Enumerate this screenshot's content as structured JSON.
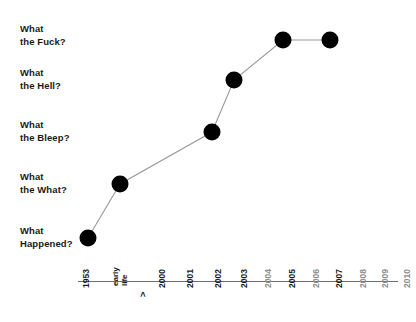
{
  "chart_data": {
    "type": "line",
    "title": "",
    "xlabel": "",
    "ylabel": "",
    "grid": false,
    "legend": "none",
    "x_tick_labels": [
      {
        "label": "1953",
        "emphasis": "bold",
        "stacked": false
      },
      {
        "label": "early life",
        "lines": [
          "early",
          "life"
        ],
        "emphasis": "bold",
        "stacked": true,
        "suffix": ">"
      },
      {
        "label": "2000",
        "emphasis": "bold",
        "stacked": false
      },
      {
        "label": "2001",
        "emphasis": "bold",
        "stacked": false
      },
      {
        "label": "2002",
        "emphasis": "bold",
        "stacked": false
      },
      {
        "label": "2003",
        "emphasis": "bold",
        "stacked": false
      },
      {
        "label": "2004",
        "emphasis": "dim",
        "stacked": false
      },
      {
        "label": "2005",
        "emphasis": "bold",
        "stacked": false
      },
      {
        "label": "2006",
        "emphasis": "dim",
        "stacked": false
      },
      {
        "label": "2007",
        "emphasis": "bold",
        "stacked": false
      },
      {
        "label": "2008",
        "emphasis": "dim",
        "stacked": false
      },
      {
        "label": "2009",
        "emphasis": "dim",
        "stacked": false
      },
      {
        "label": "2010",
        "emphasis": "dim",
        "stacked": false
      }
    ],
    "y_tick_labels": [
      {
        "lines": [
          "What",
          "the Fuck?"
        ],
        "level": 5
      },
      {
        "lines": [
          "What",
          "the Hell?"
        ],
        "level": 4
      },
      {
        "lines": [
          "What",
          "the Bleep?"
        ],
        "level": 3
      },
      {
        "lines": [
          "What",
          "the What?"
        ],
        "level": 2
      },
      {
        "lines": [
          "What",
          "Happened?"
        ],
        "level": 1
      }
    ],
    "categories": [
      "1953",
      "2000",
      "2002",
      "2003",
      "2005",
      "2007"
    ],
    "values": [
      1,
      2,
      3,
      4,
      5,
      5
    ],
    "value_labels": [
      "What Happened?",
      "What the What?",
      "What the Bleep?",
      "What the Hell?",
      "What the Fuck?",
      "What the Fuck?"
    ],
    "points_px": [
      {
        "x": 88,
        "y": 238
      },
      {
        "x": 120,
        "y": 184
      },
      {
        "x": 212,
        "y": 132
      },
      {
        "x": 234,
        "y": 80
      },
      {
        "x": 283,
        "y": 40
      },
      {
        "x": 330,
        "y": 40
      }
    ],
    "series_color": "#000000",
    "line_color": "#9a9a9a",
    "axis_color": "#6e6e6e",
    "marker_radius": 8.5
  },
  "colors": {
    "background": "#ffffff",
    "text": "#1a1a1a",
    "muted_text": "#8e8e8e",
    "marker": "#000000",
    "line": "#9a9a9a",
    "axis": "#6e6e6e"
  }
}
